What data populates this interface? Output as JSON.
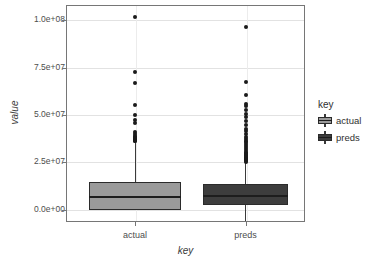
{
  "chart_data": {
    "type": "box",
    "title": "",
    "xlabel": "key",
    "ylabel": "value",
    "categories": [
      "actual",
      "preds"
    ],
    "ylim": [
      -6500000,
      108000000
    ],
    "yticks": [
      0,
      25000000,
      50000000,
      75000000,
      100000000
    ],
    "ytick_labels": [
      "0.0e+00",
      "2.5e+07",
      "5.0e+07",
      "7.5e+07",
      "1.0e+08"
    ],
    "grid": true,
    "legend": {
      "title": "key",
      "position": "right",
      "entries": [
        {
          "label": "actual",
          "color": "#9a9a9a"
        },
        {
          "label": "preds",
          "color": "#3d3d3d"
        }
      ]
    },
    "series": [
      {
        "name": "actual",
        "fill": "#9a9a9a",
        "stroke": "#2b2b2b",
        "stats": {
          "min": 0,
          "q1": 0,
          "median": 6500000,
          "q3": 14500000,
          "max": 35500000
        },
        "outliers": [
          101500000,
          72500000,
          67000000,
          55000000,
          50000000,
          47500000,
          45500000,
          41000000,
          40000000,
          39000000,
          38500000,
          38000000,
          37500000,
          37000000,
          36500000,
          36000000
        ]
      },
      {
        "name": "preds",
        "fill": "#3d3d3d",
        "stroke": "#2b2b2b",
        "stats": {
          "min": -6000000,
          "q1": 2500000,
          "median": 7000000,
          "q3": 13500000,
          "max": 24500000
        },
        "outliers": [
          96500000,
          67500000,
          60500000,
          56000000,
          54500000,
          52500000,
          50500000,
          49000000,
          47000000,
          44500000,
          42500000,
          41500000,
          40000000,
          38500000,
          37500000,
          36500000,
          35500000,
          34500000,
          33500000,
          32500000,
          31500000,
          30500000,
          30000000,
          29500000,
          29000000,
          28500000,
          28000000,
          27500000,
          27000000,
          26500000,
          26000000,
          25500000,
          25000000
        ]
      }
    ]
  }
}
